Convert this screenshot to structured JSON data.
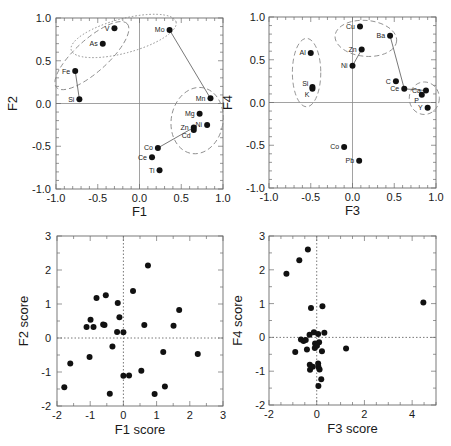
{
  "figure": {
    "panel_count": 4
  },
  "chart_data": [
    {
      "id": "loading-plot-f1-f2",
      "type": "scatter",
      "kind": "loading",
      "title": "",
      "xlabel": "F1",
      "ylabel": "F2",
      "xlim": [
        -1.0,
        1.0
      ],
      "ylim": [
        -1.0,
        1.0
      ],
      "xticks": [
        -1.0,
        -0.5,
        0.0,
        0.5,
        1.0
      ],
      "xtick_labels": [
        "-1.0",
        "-0.5",
        "0.0",
        "0.5",
        "1.0"
      ],
      "yticks": [
        -1.0,
        -0.5,
        0.0,
        0.5,
        1.0
      ],
      "ytick_labels": [
        "-1.0",
        "-0.5",
        "0.0",
        "0.5",
        "1.0"
      ],
      "minor_step": 0.1,
      "zero_lines": "solid",
      "grid": false,
      "legend": null,
      "points": [
        {
          "label": "V",
          "x": -0.3,
          "y": 0.88,
          "pos": "l"
        },
        {
          "label": "As",
          "x": -0.44,
          "y": 0.7,
          "pos": "l"
        },
        {
          "label": "Mo",
          "x": 0.36,
          "y": 0.86,
          "pos": "l"
        },
        {
          "label": "Fe",
          "x": -0.77,
          "y": 0.38,
          "pos": "l"
        },
        {
          "label": "Si",
          "x": -0.72,
          "y": 0.05,
          "pos": "l"
        },
        {
          "label": "Mn",
          "x": 0.85,
          "y": 0.06,
          "pos": "l"
        },
        {
          "label": "Mg",
          "x": 0.72,
          "y": -0.12,
          "pos": "l"
        },
        {
          "label": "Ni",
          "x": 0.81,
          "y": -0.25,
          "pos": "l"
        },
        {
          "label": "Zn",
          "x": 0.65,
          "y": -0.28,
          "pos": "l"
        },
        {
          "label": "Cd",
          "x": 0.65,
          "y": -0.31,
          "pos": "bl"
        },
        {
          "label": "Co",
          "x": 0.22,
          "y": -0.52,
          "pos": "l"
        },
        {
          "label": "Ce",
          "x": 0.15,
          "y": -0.63,
          "pos": "l"
        },
        {
          "label": "Ti",
          "x": 0.24,
          "y": -0.78,
          "pos": "l"
        }
      ],
      "connections": [
        [
          "Fe",
          "Si"
        ],
        [
          "Mo",
          "Mn"
        ],
        [
          "Co",
          "Zn"
        ]
      ],
      "ellipses": [
        {
          "members": [
            "V",
            "As",
            "Fe"
          ],
          "cx": -0.57,
          "cy": 0.56,
          "rx": 0.57,
          "ry": 0.19,
          "angle": 42,
          "style": "dashed"
        },
        {
          "members": [
            "V",
            "As",
            "Mo"
          ],
          "cx": -0.19,
          "cy": 0.79,
          "rx": 0.65,
          "ry": 0.2,
          "angle": 15,
          "style": "dotted"
        },
        {
          "members": [
            "Mn",
            "Mg",
            "Ni",
            "Zn",
            "Cd"
          ],
          "cx": 0.69,
          "cy": -0.2,
          "rx": 0.31,
          "ry": 0.39,
          "angle": -10,
          "style": "dashed"
        }
      ]
    },
    {
      "id": "loading-plot-f3-f4",
      "type": "scatter",
      "kind": "loading",
      "title": "",
      "xlabel": "F3",
      "ylabel": "F4",
      "xlim": [
        -1.0,
        1.0
      ],
      "ylim": [
        -1.0,
        1.0
      ],
      "xticks": [
        -1.0,
        -0.5,
        0.0,
        0.5,
        1.0
      ],
      "xtick_labels": [
        "-1.0",
        "-0.5",
        "0.0",
        "0.5",
        "1.0"
      ],
      "yticks": [
        -1.0,
        -0.5,
        0.0,
        0.5,
        1.0
      ],
      "ytick_labels": [
        "-1.0",
        "-0.5",
        "0.0",
        "0.5",
        "1.0"
      ],
      "minor_step": 0.1,
      "zero_lines": "solid",
      "grid": false,
      "legend": null,
      "points": [
        {
          "label": "Cu",
          "x": 0.09,
          "y": 0.89,
          "pos": "l"
        },
        {
          "label": "Ba",
          "x": 0.45,
          "y": 0.78,
          "pos": "l"
        },
        {
          "label": "Al",
          "x": -0.5,
          "y": 0.58,
          "pos": "l"
        },
        {
          "label": "Zn",
          "x": 0.11,
          "y": 0.62,
          "pos": "l"
        },
        {
          "label": "Ni",
          "x": 0.0,
          "y": 0.43,
          "pos": "l"
        },
        {
          "label": "Si",
          "x": -0.48,
          "y": 0.18,
          "pos": "tl"
        },
        {
          "label": "K",
          "x": -0.48,
          "y": 0.16,
          "pos": "bl"
        },
        {
          "label": "C",
          "x": 0.52,
          "y": 0.25,
          "pos": "l"
        },
        {
          "label": "Ce",
          "x": 0.62,
          "y": 0.16,
          "pos": "l"
        },
        {
          "label": "Ca",
          "x": 0.88,
          "y": 0.14,
          "pos": "l"
        },
        {
          "label": "P",
          "x": 0.83,
          "y": 0.09,
          "pos": "bl"
        },
        {
          "label": "Y",
          "x": 0.9,
          "y": -0.06,
          "pos": "l"
        },
        {
          "label": "Co",
          "x": -0.1,
          "y": -0.52,
          "pos": "l"
        },
        {
          "label": "Pb",
          "x": 0.08,
          "y": -0.68,
          "pos": "l"
        }
      ],
      "connections": [
        [
          "Zn",
          "Ni"
        ],
        [
          "Ba",
          "Ce"
        ],
        [
          "Ce",
          "Ca"
        ]
      ],
      "ellipses": [
        {
          "members": [
            "Al",
            "Si",
            "K"
          ],
          "cx": -0.55,
          "cy": 0.35,
          "rx": 0.17,
          "ry": 0.4,
          "angle": 0,
          "style": "dashed"
        },
        {
          "members": [
            "Cu",
            "Ba",
            "Zn"
          ],
          "cx": 0.16,
          "cy": 0.75,
          "rx": 0.37,
          "ry": 0.21,
          "angle": -5,
          "style": "dashed"
        },
        {
          "members": [
            "Ca",
            "P",
            "Y"
          ],
          "cx": 0.86,
          "cy": 0.05,
          "rx": 0.18,
          "ry": 0.19,
          "angle": 0,
          "style": "dashed"
        }
      ]
    },
    {
      "id": "score-plot-f1-f2",
      "type": "scatter",
      "kind": "score",
      "title": "",
      "xlabel": "F1 score",
      "ylabel": "F2 score",
      "xlim": [
        -2,
        3
      ],
      "ylim": [
        -2,
        3
      ],
      "xticks": [
        -2,
        -1,
        0,
        1,
        2,
        3
      ],
      "xtick_labels": [
        "-2",
        "-1",
        "0",
        "1",
        "2",
        "3"
      ],
      "yticks": [
        -2,
        -1,
        0,
        1,
        2,
        3
      ],
      "ytick_labels": [
        "-2",
        "-1",
        "0",
        "1",
        "2",
        "3"
      ],
      "minor_step": 0.5,
      "zero_lines": "dotted",
      "grid": false,
      "legend": null,
      "x": [
        0.74,
        0.29,
        -0.81,
        -0.53,
        -0.17,
        1.68,
        -0.12,
        -0.99,
        -1.11,
        -0.9,
        -0.61,
        -0.57,
        0.63,
        1.51,
        -0.19,
        0.0,
        -0.33,
        1.2,
        2.24,
        -1.02,
        -1.6,
        0.0,
        0.17,
        0.54,
        -1.78,
        -0.41,
        0.94,
        1.25
      ],
      "y": [
        2.13,
        1.38,
        1.18,
        1.26,
        1.03,
        0.82,
        0.61,
        0.54,
        0.32,
        0.32,
        0.4,
        0.38,
        0.38,
        0.36,
        0.18,
        0.17,
        -0.25,
        -0.41,
        -0.47,
        -0.56,
        -0.75,
        -1.11,
        -1.1,
        -0.96,
        -1.45,
        -1.64,
        -1.65,
        -1.43
      ]
    },
    {
      "id": "score-plot-f3-f4",
      "type": "scatter",
      "kind": "score",
      "title": "",
      "xlabel": "F3 score",
      "ylabel": "F4 score",
      "xlim": [
        -2,
        5
      ],
      "ylim": [
        -2,
        3
      ],
      "xticks": [
        -2,
        0,
        2,
        4
      ],
      "xtick_labels": [
        "-2",
        "0",
        "2",
        "4"
      ],
      "yticks": [
        -2,
        -1,
        0,
        1,
        2,
        3
      ],
      "ytick_labels": [
        "-2",
        "-1",
        "0",
        "1",
        "2",
        "3"
      ],
      "minor_step": 0.5,
      "zero_lines": "dotted",
      "grid": false,
      "legend": null,
      "x": [
        -0.37,
        -0.73,
        -1.27,
        4.47,
        -0.24,
        0.24,
        -0.12,
        -0.3,
        0.06,
        0.32,
        -0.66,
        -0.55,
        -0.46,
        -0.07,
        0.1,
        -0.08,
        0.01,
        -0.9,
        -0.41,
        0.22,
        1.23,
        -0.29,
        -0.28,
        -0.17,
        0.06,
        0.07,
        0.12,
        0.19,
        0.07
      ],
      "y": [
        2.6,
        2.28,
        1.88,
        1.03,
        0.87,
        0.92,
        0.15,
        0.08,
        0.1,
        0.14,
        -0.06,
        -0.11,
        -0.08,
        -0.18,
        -0.14,
        -0.31,
        -0.25,
        -0.43,
        -0.36,
        -0.41,
        -0.33,
        -0.81,
        -0.96,
        -0.87,
        -0.77,
        -0.87,
        -0.95,
        -1.24,
        -1.44
      ]
    }
  ]
}
